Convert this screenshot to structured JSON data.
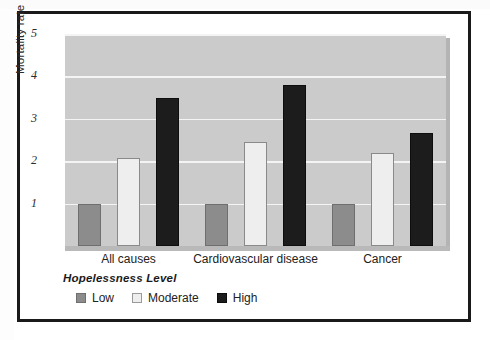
{
  "chart_data": {
    "type": "bar",
    "title": "",
    "xlabel": "",
    "ylabel": "Mortality rate",
    "ylim": [
      0,
      5
    ],
    "yticks": [
      1,
      2,
      3,
      4,
      5
    ],
    "grid": true,
    "legend_position": "bottom-left",
    "legend_title": "Hopelessness Level",
    "categories": [
      "All causes",
      "Cardiovascular disease",
      "Cancer"
    ],
    "series": [
      {
        "name": "Low",
        "color": "#8c8c8c",
        "values": [
          1.0,
          1.0,
          1.0
        ]
      },
      {
        "name": "Moderate",
        "color": "#eeeeee",
        "values": [
          2.08,
          2.45,
          2.19
        ]
      },
      {
        "name": "High",
        "color": "#1c1c1c",
        "values": [
          3.5,
          3.8,
          2.66
        ]
      }
    ]
  },
  "axis": {
    "y_title": "Mortality rate",
    "ticks": [
      {
        "label": "5",
        "value": 5
      },
      {
        "label": "4",
        "value": 4
      },
      {
        "label": "3",
        "value": 3
      },
      {
        "label": "2",
        "value": 2
      },
      {
        "label": "1",
        "value": 1
      }
    ]
  },
  "categories": [
    {
      "label": "All causes"
    },
    {
      "label": "Cardiovascular disease"
    },
    {
      "label": "Cancer"
    }
  ],
  "legend": {
    "title": "Hopelessness Level",
    "items": [
      {
        "label": "Low",
        "key": "low"
      },
      {
        "label": "Moderate",
        "key": "moderate"
      },
      {
        "label": "High",
        "key": "high"
      }
    ]
  },
  "colors": {
    "low": "#8c8c8c",
    "moderate": "#eeeeee",
    "high": "#1c1c1c",
    "plot_background": "#cbcbcb",
    "gridline": "#f4f4f4",
    "frame": "#1a1a1a"
  }
}
